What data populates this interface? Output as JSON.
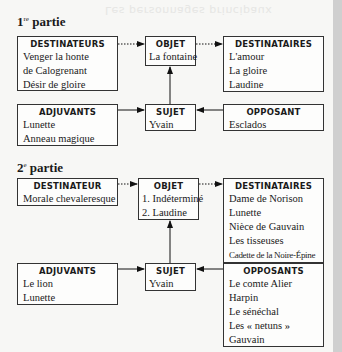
{
  "background_text": "Les personnages principaux",
  "parts": [
    {
      "title_number": "1",
      "title_suffix": "re",
      "title_text": "partie",
      "destinateurs": {
        "label": "DESTINATEURS",
        "items": [
          "Venger la honte",
          "de Calogrenant",
          "Désir de gloire"
        ]
      },
      "objet": {
        "label": "OBJET",
        "items": [
          "La fontaine"
        ]
      },
      "destinataires": {
        "label": "DESTINATAIRES",
        "items": [
          "L'amour",
          "La gloire",
          "Laudine"
        ]
      },
      "adjuvants": {
        "label": "ADJUVANTS",
        "items": [
          "Lunette",
          "Anneau magique"
        ]
      },
      "sujet": {
        "label": "SUJET",
        "items": [
          "Yvain"
        ]
      },
      "opposants": {
        "label": "OPPOSANT",
        "items": [
          "Esclados"
        ]
      }
    },
    {
      "title_number": "2",
      "title_suffix": "e",
      "title_text": "partie",
      "destinateurs": {
        "label": "DESTINATEUR",
        "items": [
          "Morale chevaleresque"
        ]
      },
      "objet": {
        "label": "OBJET",
        "items": [
          "1. Indéterminé",
          "2. Laudine"
        ]
      },
      "destinataires": {
        "label": "DESTINATAIRES",
        "items": [
          "Dame de Norison",
          "Lunette",
          "Nièce de Gauvain",
          "Les tisseuses",
          "Cadette de la Noire-Épine"
        ]
      },
      "adjuvants": {
        "label": "ADJUVANTS",
        "items": [
          "Le lion",
          "Lunette"
        ]
      },
      "sujet": {
        "label": "SUJET",
        "items": [
          "Yvain"
        ]
      },
      "opposants": {
        "label": "OPPOSANTS",
        "items": [
          "Le comte Alier",
          "Harpin",
          "Le sénéchal",
          "Les « netuns »",
          "Gauvain"
        ]
      }
    }
  ]
}
